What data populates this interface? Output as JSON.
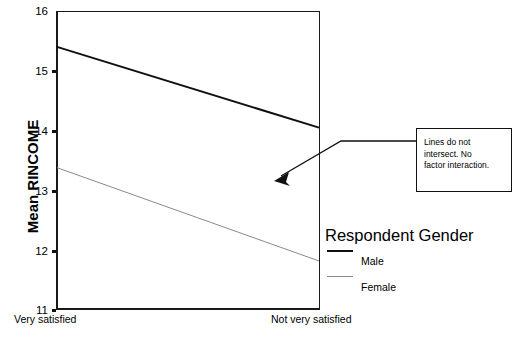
{
  "chart_data": {
    "type": "line",
    "title": "",
    "xlabel": "",
    "ylabel": "Mean RINCOME",
    "categories": [
      "Very satisfied",
      "Not very satisfied"
    ],
    "xtick_labels": [
      "Very satisfied",
      "Not very satisfied"
    ],
    "ytick_labels": [
      "16",
      "15",
      "14",
      "13",
      "12",
      "11"
    ],
    "ytick_values": [
      16,
      15,
      14,
      13,
      12,
      11
    ],
    "ylim": [
      11,
      16
    ],
    "grid": false,
    "legend_position": "right",
    "legend_title": "Respondent Gender",
    "series": [
      {
        "name": "Male",
        "values": [
          15.4,
          14.05
        ],
        "color": "#101010",
        "width": 2
      },
      {
        "name": "Female",
        "values": [
          13.38,
          11.82
        ],
        "color": "#8a8a8a",
        "width": 1
      }
    ],
    "annotations": [
      {
        "text": "Lines do not intersect.  No factor interaction.",
        "points_to": "plot-interior"
      }
    ]
  },
  "axis": {
    "ylabel": "Mean RINCOME",
    "yticks": [
      {
        "label": "16",
        "value": 16
      },
      {
        "label": "15",
        "value": 15
      },
      {
        "label": "14",
        "value": 14
      },
      {
        "label": "13",
        "value": 13
      },
      {
        "label": "12",
        "value": 12
      },
      {
        "label": "11",
        "value": 11
      }
    ],
    "xticks": [
      {
        "label": "Very satisfied"
      },
      {
        "label": "Not very satisfied"
      }
    ]
  },
  "legend": {
    "title": "Respondent Gender",
    "entries": [
      {
        "label": "Male",
        "swatch": "solid-dark-line"
      },
      {
        "label": "Female",
        "swatch": "solid-light-line"
      }
    ]
  },
  "callout": {
    "line1": "Lines do not",
    "line2": "intersect.  No",
    "line3": "factor interaction.",
    "full_text": "Lines do not intersect.  No factor interaction."
  },
  "colors": {
    "axis": "#1a1a1a",
    "male_line": "#101010",
    "female_line": "#8a8a8a",
    "callout_border": "#111111",
    "background": "#ffffff"
  }
}
